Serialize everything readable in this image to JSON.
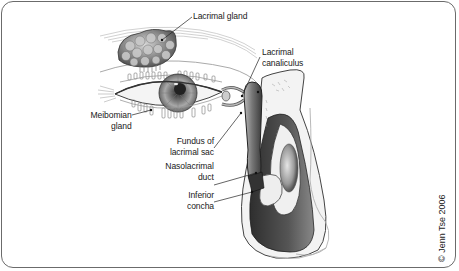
{
  "figure": {
    "labels": {
      "lacrimal_gland": "Lacrimal gland",
      "lacrimal_canaliculus_line1": "Lacrimal",
      "lacrimal_canaliculus_line2": "canaliculus",
      "meibomian_gland_line1": "Meibomian",
      "meibomian_gland_line2": "gland",
      "fundus_line1": "Fundus of",
      "fundus_line2": "lacrimal sac",
      "nasolacrimal_line1": "Nasolacrimal",
      "nasolacrimal_line2": "duct",
      "inferior_concha_line1": "Inferior",
      "inferior_concha_line2": "concha"
    },
    "copyright": "© Jenn Tse 2006",
    "colors": {
      "border": "#6b6b6b",
      "ink": "#1a1a1a",
      "shadow": "#3a3a3a",
      "tissue": "#9a9a9a",
      "background": "#ffffff"
    }
  }
}
